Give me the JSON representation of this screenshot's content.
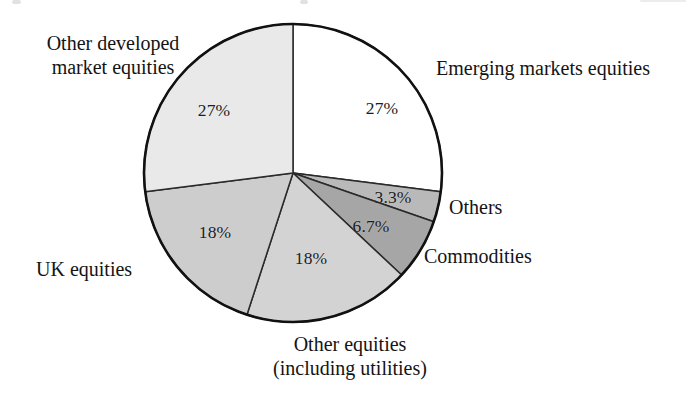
{
  "chart_data": {
    "type": "pie",
    "title": "",
    "subtitle": "",
    "xlabel": "",
    "ylabel": "",
    "legend_position": "none",
    "grid": false,
    "units": "percent",
    "total": 100,
    "start_angle_deg": 0,
    "direction": "clockwise",
    "categories": [
      "Emerging markets equities",
      "Others",
      "Commodities",
      "Other equities (including utilities)",
      "UK equities",
      "Other developed market equities"
    ],
    "values": [
      27,
      3.3,
      6.7,
      18,
      18,
      27
    ],
    "value_labels": [
      "27%",
      "3.3%",
      "6.7%",
      "18%",
      "18%",
      "27%"
    ],
    "slices": [
      {
        "name": "Emerging markets equities",
        "value": 27,
        "value_label": "27%",
        "color": "#ffffff",
        "start_deg": 0,
        "end_deg": 97.2,
        "label_lines": [
          "Emerging markets equities"
        ],
        "label_placement": "outside-right"
      },
      {
        "name": "Others",
        "value": 3.3,
        "value_label": "3.3%",
        "color": "#b9b9b9",
        "start_deg": 97.2,
        "end_deg": 109.08,
        "label_lines": [
          "Others"
        ],
        "label_placement": "outside-right"
      },
      {
        "name": "Commodities",
        "value": 6.7,
        "value_label": "6.7%",
        "color": "#a6a6a6",
        "start_deg": 109.08,
        "end_deg": 133.2,
        "label_lines": [
          "Commodities"
        ],
        "label_placement": "outside-right"
      },
      {
        "name": "Other equities (including utilities)",
        "value": 18,
        "value_label": "18%",
        "color": "#d3d3d3",
        "start_deg": 133.2,
        "end_deg": 198.0,
        "label_lines": [
          "Other equities",
          "(including utilities)"
        ],
        "label_placement": "outside-bottom"
      },
      {
        "name": "UK equities",
        "value": 18,
        "value_label": "18%",
        "color": "#cdcdcd",
        "start_deg": 198.0,
        "end_deg": 262.8,
        "label_lines": [
          "UK equities"
        ],
        "label_placement": "outside-left"
      },
      {
        "name": "Other developed market equities",
        "value": 27,
        "value_label": "27%",
        "color": "#e9e9e9",
        "start_deg": 262.8,
        "end_deg": 360.0,
        "label_lines": [
          "Other developed",
          "market equities"
        ],
        "label_placement": "outside-top-left"
      }
    ]
  },
  "labels": {
    "emerging_markets": "Emerging markets equities",
    "others": "Others",
    "commodities": "Commodities",
    "other_equities_line1": "Other equities",
    "other_equities_line2": "(including utilities)",
    "uk_equities": "UK equities",
    "other_developed_line1": "Other developed",
    "other_developed_line2": "market equities"
  },
  "percentages": {
    "emerging_markets": "27%",
    "others": "3.3%",
    "commodities": "6.7%",
    "other_equities": "18%",
    "uk_equities": "18%",
    "other_developed": "27%"
  },
  "colors": {
    "outline": "#111111",
    "slice_divider": "#2a2a2a",
    "text": "#141414",
    "background": "#ffffff"
  }
}
